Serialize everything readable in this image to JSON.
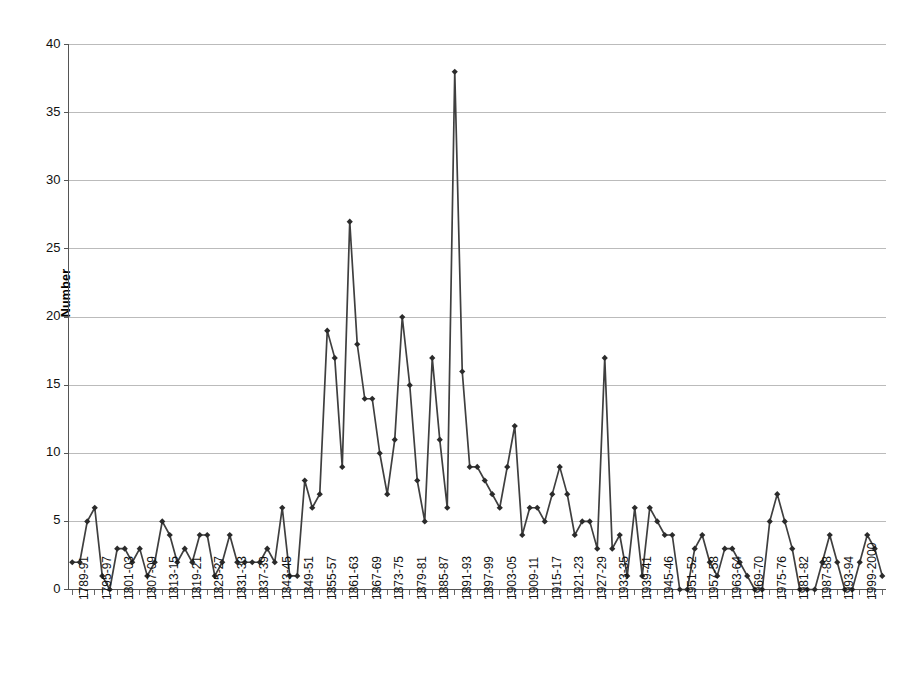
{
  "chart_data": {
    "type": "line",
    "title": "",
    "xlabel": "",
    "ylabel": "Number",
    "ylim": [
      0,
      40
    ],
    "ytick_labels": [
      "0",
      "5",
      "10",
      "15",
      "20",
      "25",
      "30",
      "35",
      "40"
    ],
    "yticks": [
      0,
      5,
      10,
      15,
      20,
      25,
      30,
      35,
      40
    ],
    "grid": true,
    "grid_axis": "y",
    "legend": "none",
    "marker": "diamond",
    "line_color": "#3f3f3f",
    "marker_color": "#2b2b2b",
    "grid_color": "#b4b4b4",
    "axis_color": "#555555",
    "x_tick_labels": [
      "1789-91",
      "1795-97",
      "1801-03",
      "1807-09",
      "1813-15",
      "1819-21",
      "1825-27",
      "1831-33",
      "1837-39",
      "1843-45",
      "1849-51",
      "1855-57",
      "1861-63",
      "1867-69",
      "1873-75",
      "1879-81",
      "1885-87",
      "1891-93",
      "1897-99",
      "1903-05",
      "1909-11",
      "1915-17",
      "1921-23",
      "1927-29",
      "1933-35",
      "1939-41",
      "1945-46",
      "1951-52",
      "1957-58",
      "1963-64",
      "1969-70",
      "1975-76",
      "1981-82",
      "1987-88",
      "1993-94",
      "1999-2000"
    ],
    "x_label_every": 3,
    "values": [
      2,
      2,
      5,
      6,
      1,
      0,
      3,
      3,
      2,
      3,
      1,
      2,
      5,
      4,
      2,
      3,
      2,
      4,
      4,
      1,
      2,
      4,
      2,
      2,
      2,
      2,
      3,
      2,
      6,
      1,
      1,
      8,
      6,
      7,
      19,
      17,
      9,
      27,
      18,
      14,
      14,
      10,
      7,
      11,
      20,
      15,
      8,
      5,
      17,
      11,
      6,
      38,
      16,
      9,
      9,
      8,
      7,
      6,
      9,
      12,
      4,
      6,
      6,
      5,
      7,
      9,
      7,
      4,
      5,
      5,
      3,
      17,
      3,
      4,
      1,
      6,
      1,
      6,
      5,
      4,
      4,
      0,
      0,
      3,
      4,
      2,
      1,
      3,
      3,
      2,
      1,
      0,
      0,
      5,
      7,
      5,
      3,
      0,
      0,
      0,
      2,
      4,
      2,
      0,
      0,
      2,
      4,
      3,
      1
    ]
  }
}
